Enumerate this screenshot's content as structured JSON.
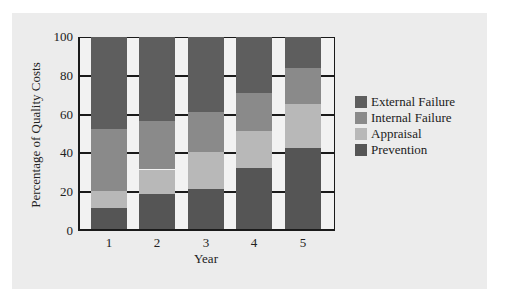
{
  "chart_data": {
    "type": "bar",
    "stacked": true,
    "title": "",
    "xlabel": "Year",
    "ylabel": "Percentage of Quality Costs",
    "categories": [
      "1",
      "2",
      "3",
      "4",
      "5"
    ],
    "ylim": [
      0,
      100
    ],
    "yticks": [
      "0",
      "20",
      "40",
      "60",
      "80",
      "100"
    ],
    "grid": "horizontal tick segments in gaps",
    "legend_position": "right",
    "series": [
      {
        "name": "Prevention",
        "color": "#555555",
        "values": [
          11,
          18,
          21,
          32,
          42
        ]
      },
      {
        "name": "Appraisal",
        "color": "#b8b8b8",
        "values": [
          9,
          13,
          19,
          19,
          23
        ]
      },
      {
        "name": "Internal Failure",
        "color": "#8a8a8a",
        "values": [
          32,
          25,
          21,
          20,
          19
        ]
      },
      {
        "name": "External Failure",
        "color": "#5e5e5e",
        "values": [
          48,
          44,
          39,
          29,
          16
        ]
      }
    ]
  },
  "legend": {
    "items": [
      {
        "label": "External Failure",
        "color": "#5e5e5e"
      },
      {
        "label": "Internal Failure",
        "color": "#8a8a8a"
      },
      {
        "label": "Appraisal",
        "color": "#b8b8b8"
      },
      {
        "label": "Prevention",
        "color": "#555555"
      }
    ]
  },
  "axes": {
    "xlabel": "Year",
    "ylabel": "Percentage of Quality Costs",
    "yticks": [
      "0",
      "20",
      "40",
      "60",
      "80",
      "100"
    ],
    "xticks": [
      "1",
      "2",
      "3",
      "4",
      "5"
    ]
  }
}
